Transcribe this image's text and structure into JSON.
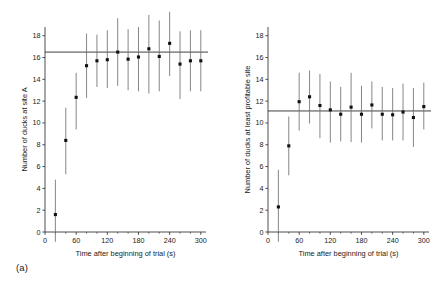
{
  "figure": {
    "panels": [
      {
        "caption": "(a)",
        "caption_name": "panel-a-caption"
      },
      {
        "caption": "(b)",
        "caption_name": "panel-b-caption"
      }
    ]
  },
  "chart_data": [
    {
      "type": "scatter",
      "panel": "a",
      "title": "",
      "xlabel": "Time after beginning of trial (s)",
      "ylabel": "Number of ducks at site A",
      "xlim": [
        0,
        310
      ],
      "ylim": [
        0,
        18.8
      ],
      "xticks": [
        0,
        60,
        120,
        180,
        240,
        300
      ],
      "xticklabels": [
        "0",
        "60",
        "120",
        "180",
        "240",
        "300"
      ],
      "xminorticks": [
        20,
        40,
        80,
        100,
        140,
        160,
        200,
        220,
        260,
        280
      ],
      "yticks": [
        0,
        2,
        4,
        6,
        8,
        10,
        12,
        14,
        16,
        18
      ],
      "yticklabels": [
        "0",
        "2",
        "4",
        "6",
        "8",
        "10",
        "12",
        "14",
        "16",
        "18"
      ],
      "grid": false,
      "legend": "none",
      "reference_line": {
        "orientation": "horizontal",
        "y": 16.5,
        "label": ""
      },
      "x": [
        20,
        40,
        60,
        80,
        100,
        120,
        140,
        160,
        180,
        200,
        220,
        240,
        260,
        280,
        300
      ],
      "values": [
        1.6,
        8.4,
        12.35,
        15.25,
        15.7,
        15.8,
        16.5,
        15.85,
        16.05,
        16.8,
        16.1,
        17.3,
        15.4,
        15.7,
        15.7
      ],
      "error_low": [
        -1.1,
        5.3,
        9.4,
        12.3,
        13.3,
        13.2,
        13.4,
        13.0,
        12.9,
        12.7,
        12.9,
        14.3,
        12.2,
        12.9,
        12.9
      ],
      "error_high": [
        4.8,
        11.4,
        14.6,
        18.2,
        18.1,
        18.5,
        19.6,
        18.6,
        18.8,
        19.9,
        19.4,
        20.3,
        18.4,
        18.5,
        18.5
      ],
      "error_type": "95% confidence interval",
      "marker": "filled-square"
    },
    {
      "type": "scatter",
      "panel": "b",
      "title": "",
      "xlabel": "Time after beginning of trial (s)",
      "ylabel": "Number of ducks at least profitable site",
      "xlim": [
        0,
        310
      ],
      "ylim": [
        0,
        18.8
      ],
      "xticks": [
        0,
        60,
        120,
        180,
        240,
        300
      ],
      "xticklabels": [
        "0",
        "60",
        "120",
        "180",
        "240",
        "300"
      ],
      "xminorticks": [
        20,
        40,
        80,
        100,
        140,
        160,
        200,
        220,
        260,
        280
      ],
      "yticks": [
        0,
        2,
        4,
        6,
        8,
        10,
        12,
        14,
        16,
        18
      ],
      "yticklabels": [
        "0",
        "2",
        "4",
        "6",
        "8",
        "10",
        "12",
        "14",
        "16",
        "18"
      ],
      "grid": false,
      "legend": "none",
      "reference_line": {
        "orientation": "horizontal",
        "y": 11.1,
        "label": ""
      },
      "x": [
        20,
        40,
        60,
        80,
        100,
        120,
        140,
        160,
        180,
        200,
        220,
        240,
        260,
        280,
        300
      ],
      "values": [
        2.3,
        7.9,
        11.95,
        12.4,
        11.6,
        11.2,
        10.8,
        11.45,
        10.8,
        11.65,
        10.8,
        10.75,
        11.0,
        10.5,
        11.5
      ],
      "error_low": [
        -1.3,
        5.2,
        9.3,
        9.95,
        8.6,
        8.2,
        8.3,
        8.25,
        8.2,
        9.5,
        8.4,
        8.4,
        8.4,
        7.8,
        9.4
      ],
      "error_high": [
        5.7,
        10.6,
        14.6,
        14.8,
        14.5,
        13.8,
        13.3,
        14.6,
        13.4,
        13.8,
        13.3,
        13.2,
        13.6,
        13.2,
        13.7
      ],
      "error_type": "95% confidence interval",
      "marker": "filled-square"
    }
  ]
}
